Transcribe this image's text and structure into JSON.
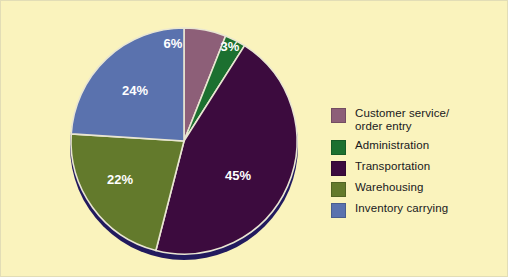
{
  "background_color": "#faf3bd",
  "chart_data": {
    "type": "pie",
    "title": "",
    "subtitle": "",
    "xlabel": "",
    "ylabel": "",
    "grid": false,
    "legend_position": "right",
    "start_angle_deg": 0,
    "direction": "clockwise",
    "categories": [
      "Customer service/ order entry",
      "Administration",
      "Transportation",
      "Warehousing",
      "Inventory carrying"
    ],
    "values": [
      6,
      3,
      45,
      22,
      24
    ],
    "value_unit": "%",
    "data_labels": [
      "6%",
      "3%",
      "45%",
      "22%",
      "24%"
    ],
    "colors": [
      "#8d5f78",
      "#1c7030",
      "#3c0b3e",
      "#637a2c",
      "#5a72ae"
    ],
    "slices": [
      {
        "label": "Customer service/ order entry",
        "legend_label": "Customer service/\norder entry",
        "value": 6,
        "data_label": "6%",
        "color": "#8d5f78",
        "label_x": 172,
        "label_y": 44
      },
      {
        "label": "Administration",
        "legend_label": "Administration",
        "value": 3,
        "data_label": "3%",
        "color": "#1c7030",
        "label_x": 229,
        "label_y": 47
      },
      {
        "label": "Transportation",
        "legend_label": "Transportation",
        "value": 45,
        "data_label": "45%",
        "color": "#3c0b3e",
        "label_x": 237,
        "label_y": 176
      },
      {
        "label": "Warehousing",
        "legend_label": "Warehousing",
        "value": 22,
        "data_label": "22%",
        "color": "#637a2c",
        "label_x": 119,
        "label_y": 180
      },
      {
        "label": "Inventory carrying",
        "legend_label": "Inventory carrying",
        "value": 24,
        "data_label": "24%",
        "color": "#5a72ae",
        "label_x": 134,
        "label_y": 91
      }
    ],
    "rim_color": "#221a5e",
    "slice_separator_color": "#e9e6d2"
  },
  "legend": {
    "items": [
      {
        "label": "Customer service/\norder entry",
        "color": "#8d5f78"
      },
      {
        "label": "Administration",
        "color": "#1c7030"
      },
      {
        "label": "Transportation",
        "color": "#3c0b3e"
      },
      {
        "label": "Warehousing",
        "color": "#637a2c"
      },
      {
        "label": "Inventory carrying",
        "color": "#5a72ae"
      }
    ]
  }
}
